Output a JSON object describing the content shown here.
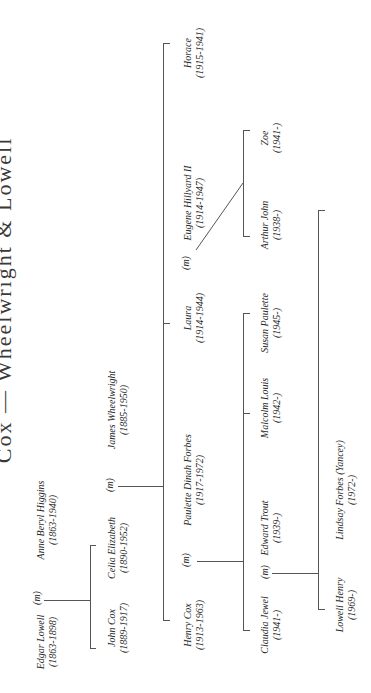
{
  "title": "Cox — Wheelwright & Lowell",
  "marriage_label": "(m)",
  "generation_1": {
    "edgar": {
      "name": "Edgar Lowell",
      "dates": "(1863-1898)"
    },
    "anne": {
      "name": "Anne Beryl Higgins",
      "dates": "(1863-1940)"
    }
  },
  "generation_2": {
    "john": {
      "name": "John Cox",
      "dates": "(1889-1917)"
    },
    "celia": {
      "name": "Celia Elizabeth",
      "dates": "(1890-1952)"
    },
    "james": {
      "name": "James Wheelwright",
      "dates": "(1885-1950)"
    }
  },
  "generation_3": {
    "henry": {
      "name": "Henry Cox",
      "dates": "(1913-1963)"
    },
    "paulette": {
      "name": "Paulette Dinah Forbes",
      "dates": "(1917-1972)"
    },
    "laura": {
      "name": "Laura",
      "dates": "(1914-1944)"
    },
    "eugene": {
      "name": "Eugene Hillyard II",
      "dates": "(1914-1947)"
    },
    "horace": {
      "name": "Horace",
      "dates": "(1915-1941)"
    }
  },
  "generation_4": {
    "claudia": {
      "name": "Claudia Jewel",
      "dates": "(1941-)"
    },
    "edward": {
      "name": "Edward Trout",
      "dates": "(1939-)"
    },
    "malcolm": {
      "name": "Malcolm Louis",
      "dates": "(1942-)"
    },
    "susan": {
      "name": "Susan Paulette",
      "dates": "(1945-)"
    },
    "arthur": {
      "name": "Arthur John",
      "dates": "(1938-)"
    },
    "zoe": {
      "name": "Zoe",
      "dates": "(1941-)"
    }
  },
  "generation_5": {
    "lowell": {
      "name": "Lowell Henry",
      "dates": "(1969-)"
    },
    "lindsay": {
      "name": "Lindsay Forbes (Yancey)",
      "dates": "(1972-)"
    }
  },
  "colors": {
    "line": "#555555",
    "text": "#2a2a2a",
    "background": "#ffffff"
  }
}
